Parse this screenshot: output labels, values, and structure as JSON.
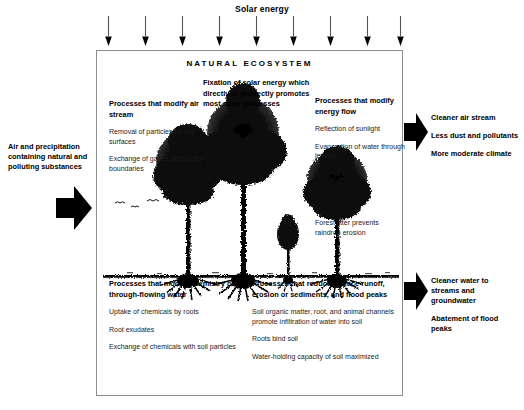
{
  "diagram": {
    "solar": {
      "title": "Solar energy",
      "arrow_count": 9,
      "arrow_icon": "down-arrow-icon"
    },
    "box_title": "NATURAL ECOSYSTEM",
    "blocks": {
      "fixation": {
        "heading": "Fixation of solar energy which directly or indirectly promotes most other processes",
        "items": []
      },
      "air_stream": {
        "heading": "Processes that modify air stream",
        "items": [
          "Removal of particles by leaf surfaces",
          "Exchange of gases across leaf boundaries"
        ]
      },
      "energy_flow": {
        "heading": "Processes that modify energy flow",
        "items": [
          "Reflection of sunlight",
          "Evaporation of water through leaves"
        ]
      },
      "litter": {
        "heading": "",
        "items": [
          "Forest litter prevents raindrop erosion"
        ]
      },
      "chemistry": {
        "heading": "Processes that modify chemistry of through-flowing water",
        "items": [
          "Uptake of chemicals by roots",
          "Root exudates",
          "Exchange of chemicals with soil particles"
        ]
      },
      "runoff": {
        "heading": "Processes that reduce surface runoff, erosion or sediments, and flood peaks",
        "items": [
          "Soil organic matter, root, and animal channels promote infiltration of water into soil",
          "Roots bind soil",
          "Water-holding capacity of soil maximized"
        ]
      }
    },
    "inputs": {
      "arrow_icon": "right-block-arrow-icon",
      "labels": [
        "Air and precipitation containing natural and polluting substances"
      ]
    },
    "outputs_air": {
      "arrow_icon": "right-block-arrow-icon",
      "labels": [
        "Cleaner air stream",
        "Less dust and pollutants",
        "More moderate climate"
      ]
    },
    "outputs_water": {
      "arrow_icon": "right-block-arrow-icon",
      "labels": [
        "Cleaner water to streams and groundwater",
        "Abatement of flood peaks"
      ]
    },
    "illustration": {
      "name": "forest-trees-illustration",
      "description": "Black-and-white line drawing of four trees with roots above a ground line, with small birds at left",
      "tree_count": 4,
      "bird_count": 4
    },
    "colors": {
      "ink": "#000000",
      "box_border": "#8e8e8e",
      "background": "#ffffff"
    }
  }
}
